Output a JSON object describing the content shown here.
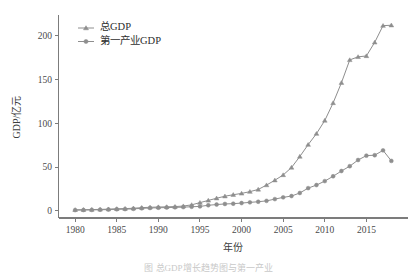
{
  "figure": {
    "caption": "图    总GDP增长趋势图与第一产业",
    "background_color": "#ffffff",
    "line_color": "#8e8e8e",
    "axis_color": "#7c7c7c"
  },
  "legend": {
    "position": "upper-left",
    "entries": [
      {
        "label": "总GDP",
        "marker": "triangle-up-icon"
      },
      {
        "label": "第一产业GDP",
        "marker": "circle-icon"
      }
    ]
  },
  "axes": {
    "y_title": "GDP/亿元",
    "x_title": "年份",
    "y_ticks": [
      "0",
      "50",
      "100",
      "150",
      "200"
    ],
    "x_ticks": [
      "1980",
      "1985",
      "1990",
      "1995",
      "2000",
      "2005",
      "2010",
      "2015"
    ]
  },
  "chart_data": {
    "type": "line",
    "title": "",
    "xlabel": "年份",
    "ylabel": "GDP/亿元",
    "xlim": [
      1978.0,
      2020.0
    ],
    "ylim": [
      -8,
      222
    ],
    "y_ticks": [
      0,
      50,
      100,
      150,
      200
    ],
    "x_ticks": [
      1980,
      1985,
      1990,
      1995,
      2000,
      2005,
      2010,
      2015
    ],
    "grid": false,
    "legend_position": "upper left",
    "x": [
      1980,
      1981,
      1982,
      1983,
      1984,
      1985,
      1986,
      1987,
      1988,
      1989,
      1990,
      1991,
      1992,
      1993,
      1994,
      1995,
      1996,
      1997,
      1998,
      1999,
      2000,
      2001,
      2002,
      2003,
      2004,
      2005,
      2006,
      2007,
      2008,
      2009,
      2010,
      2011,
      2012,
      2013,
      2014,
      2015,
      2016,
      2017,
      2018
    ],
    "series": [
      {
        "name": "总GDP",
        "marker": "triangle-up",
        "values": [
          1.3,
          1.4,
          1.6,
          1.8,
          2.1,
          2.5,
          2.7,
          3.1,
          3.8,
          4.2,
          4.5,
          4.7,
          5.0,
          5.6,
          7.0,
          9.5,
          12.0,
          14.5,
          16.8,
          18.5,
          20.0,
          22.0,
          24.5,
          29.5,
          35.0,
          41.0,
          49.5,
          62.0,
          75.5,
          88.0,
          103.0,
          123.0,
          146.0,
          172.0,
          175.5,
          176.5,
          192.0,
          211.0,
          211.5
        ]
      },
      {
        "name": "第一产业GDP",
        "marker": "circle",
        "values": [
          1.0,
          1.1,
          1.2,
          1.4,
          1.6,
          1.9,
          2.1,
          2.4,
          3.0,
          3.4,
          3.7,
          3.9,
          4.1,
          4.4,
          4.8,
          5.2,
          6.5,
          7.3,
          8.0,
          8.3,
          9.0,
          9.8,
          10.5,
          11.5,
          13.5,
          15.5,
          17.0,
          20.5,
          26.0,
          29.5,
          34.0,
          39.5,
          45.5,
          51.0,
          58.0,
          63.0,
          63.5,
          69.0,
          57.0
        ]
      }
    ]
  }
}
